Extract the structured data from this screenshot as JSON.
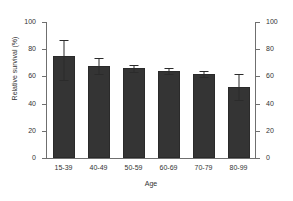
{
  "chart_data": {
    "type": "bar",
    "title": "",
    "xlabel": "Age",
    "ylabel": "Relative survival (%)",
    "categories": [
      "15-39",
      "40-49",
      "50-59",
      "60-69",
      "70-79",
      "80-99"
    ],
    "values": [
      75,
      68,
      66,
      64,
      61.5,
      52.5
    ],
    "error_low": [
      57,
      62,
      63,
      61.5,
      59.5,
      42.5
    ],
    "error_high": [
      87,
      73.5,
      68.5,
      66,
      64,
      62
    ],
    "ylim": [
      0,
      100
    ],
    "yticks": [
      0,
      20,
      40,
      60,
      80,
      100
    ],
    "ytick_labels": [
      "0",
      "20",
      "40",
      "60",
      "80",
      "100"
    ],
    "right_axis": {
      "ylim": [
        0,
        100
      ],
      "yticks": [
        0,
        20,
        40,
        60,
        80,
        100
      ],
      "ytick_labels": [
        "0",
        "20",
        "40",
        "60",
        "80",
        "100"
      ]
    },
    "grid": false,
    "legend": false,
    "bar_color": "#343434",
    "axis_color": "#6f6f6f",
    "error_bar_color": "#2b2b2b"
  }
}
